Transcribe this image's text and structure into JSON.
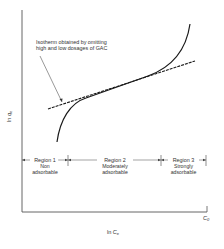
{
  "diagram": {
    "annotation": {
      "line1": "Isotherm obtained by omitting",
      "line2": "high and low dosages of GAC"
    },
    "axes": {
      "y_label_prefix": "ln ",
      "y_label_var": "q",
      "y_label_sub": "e",
      "x_label_prefix": "ln ",
      "x_label_var": "C",
      "x_label_sub": "e",
      "x_end_var": "C",
      "x_end_sub": "0"
    },
    "regions": [
      {
        "title": "Region 1",
        "line1": "Non",
        "line2": "adsorbable"
      },
      {
        "title": "Region 2",
        "line1": "Moderately",
        "line2": "adsorbable"
      },
      {
        "title": "Region 3",
        "line1": "Strongly",
        "line2": "adsorbable"
      }
    ],
    "colors": {
      "line": "#1a1a1a",
      "axis": "#555555",
      "background": "#ffffff"
    }
  }
}
